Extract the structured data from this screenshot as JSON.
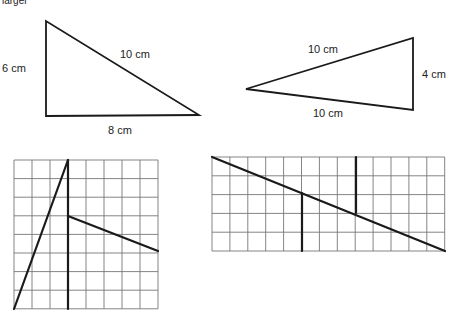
{
  "header": {
    "partial_text": "larger"
  },
  "triangle_a": {
    "vertices": [
      [
        46,
        21
      ],
      [
        46,
        116
      ],
      [
        199,
        115
      ]
    ],
    "labels": {
      "left": "6 cm",
      "hypotenuse": "10 cm",
      "bottom": "8 cm"
    }
  },
  "triangle_b": {
    "vertices": [
      [
        246,
        89
      ],
      [
        413,
        38
      ],
      [
        413,
        110
      ]
    ],
    "labels": {
      "top": "10 cm",
      "right": "4 cm",
      "bottom": "10 cm"
    }
  },
  "grid_a": {
    "x": 14,
    "y": 160,
    "cols": 8,
    "rows": 8,
    "cell_w": 18,
    "cell_h": 18.6,
    "segments": [
      {
        "x1": 14,
        "y1": 309,
        "x2": 68,
        "y2": 160
      },
      {
        "x1": 68,
        "y1": 160,
        "x2": 68,
        "y2": 309
      },
      {
        "x1": 68,
        "y1": 216,
        "x2": 158,
        "y2": 251
      }
    ]
  },
  "grid_b": {
    "x": 212,
    "y": 157,
    "cols": 13,
    "rows": 5,
    "cell_w": 17.9,
    "cell_h": 18.8,
    "segments": [
      {
        "x1": 212,
        "y1": 157,
        "x2": 445,
        "y2": 251
      },
      {
        "x1": 302,
        "y1": 193,
        "x2": 302,
        "y2": 251
      },
      {
        "x1": 356,
        "y1": 157,
        "x2": 356,
        "y2": 213
      }
    ]
  }
}
